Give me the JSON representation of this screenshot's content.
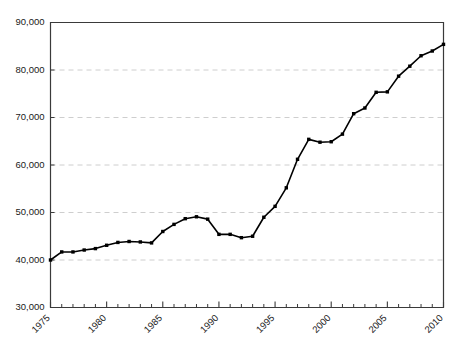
{
  "chart_data": {
    "type": "line",
    "title": "",
    "subtitle": "",
    "xlabel": "",
    "ylabel": "",
    "xlim": [
      1975,
      2010
    ],
    "ylim": [
      30000,
      90000
    ],
    "grid": true,
    "legend": false,
    "legend_position": "none",
    "y_tick_labels": [
      "90,000",
      "80,000",
      "70,000",
      "60,000",
      "50,000",
      "40,000",
      "30,000"
    ],
    "y_tick_values": [
      90000,
      80000,
      70000,
      60000,
      50000,
      40000,
      30000
    ],
    "x_tick_labels": [
      "1975",
      "1980",
      "1985",
      "1990",
      "1995",
      "2000",
      "2005",
      "2010"
    ],
    "x_tick_values": [
      1975,
      1980,
      1985,
      1990,
      1995,
      2000,
      2005,
      2010
    ],
    "x_minor_tick_interval": 1,
    "line_color": "#000000",
    "marker_color": "#000000",
    "marker_style": "square",
    "grid_color": "#c8c8c8",
    "axis_color": "#3a3a3a",
    "x": [
      1975,
      1976,
      1977,
      1978,
      1979,
      1980,
      1981,
      1982,
      1983,
      1984,
      1985,
      1986,
      1987,
      1988,
      1989,
      1990,
      1991,
      1992,
      1993,
      1994,
      1995,
      1996,
      1997,
      1998,
      1999,
      2000,
      2001,
      2002,
      2003,
      2004,
      2005,
      2006,
      2007,
      2008,
      2009,
      2010
    ],
    "values": [
      40000,
      41700,
      41700,
      42100,
      42400,
      43100,
      43700,
      43900,
      43800,
      43600,
      46000,
      47500,
      48700,
      49100,
      48600,
      45400,
      45400,
      44700,
      45000,
      49000,
      51300,
      55200,
      61200,
      65400,
      64800,
      64900,
      66500,
      70800,
      72000,
      75300,
      75400,
      78700,
      80800,
      83000,
      84000,
      85400
    ],
    "series": [
      {
        "name": "series-1",
        "values": [
          40000,
          41700,
          41700,
          42100,
          42400,
          43100,
          43700,
          43900,
          43800,
          43600,
          46000,
          47500,
          48700,
          49100,
          48600,
          45400,
          45400,
          44700,
          45000,
          49000,
          51300,
          55200,
          61200,
          65400,
          64800,
          64900,
          66500,
          70800,
          72000,
          75300,
          75400,
          78700,
          80800,
          83000,
          84000,
          85400
        ]
      }
    ]
  }
}
